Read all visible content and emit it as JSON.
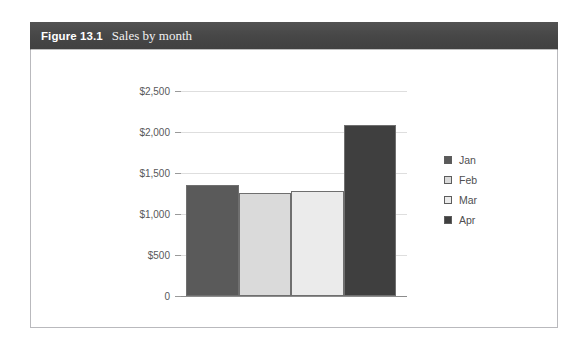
{
  "figure": {
    "number": "Figure 13.1",
    "title": "Sales by month"
  },
  "chart_data": {
    "type": "bar",
    "title": "Sales by month",
    "xlabel": "",
    "ylabel": "",
    "categories": [
      "Jan",
      "Feb",
      "Mar",
      "Apr"
    ],
    "values": [
      1350,
      1260,
      1280,
      2080
    ],
    "series": [
      {
        "name": "Sales",
        "values": [
          1350,
          1260,
          1280,
          2080
        ]
      }
    ],
    "ylim": [
      0,
      2500
    ],
    "ytick_values": [
      2500,
      2000,
      1500,
      1000,
      500,
      0
    ],
    "ytick_labels": [
      "$2,500",
      "$2,000",
      "$1,500",
      "$1,000",
      "$500",
      "0"
    ],
    "grid": true,
    "legend_position": "right",
    "legend": [
      {
        "label": "Jan",
        "color": "#5a5a5a"
      },
      {
        "label": "Feb",
        "color": "#dadada"
      },
      {
        "label": "Mar",
        "color": "#ebebeb"
      },
      {
        "label": "Apr",
        "color": "#3f3f3f"
      }
    ],
    "bar_colors": [
      "#5a5a5a",
      "#dadada",
      "#ebebeb",
      "#3f3f3f"
    ],
    "bar_border_color": "#6f6f6f",
    "gridline_color": "#dedede",
    "axis_color": "#8c8c8c",
    "tick_label_color": "#58585a"
  },
  "theme": {
    "header_background": "#4a4a4a",
    "header_text": "#ffffff",
    "frame_border": "#b9b9bd",
    "page_background": "#ffffff"
  }
}
